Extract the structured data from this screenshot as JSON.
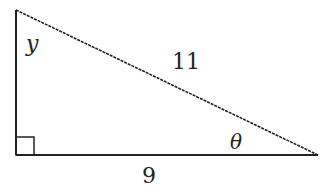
{
  "diagram": {
    "type": "right-triangle",
    "vertices": {
      "top": [
        16,
        10
      ],
      "right_angle": [
        16,
        155
      ],
      "right": [
        318,
        155
      ]
    },
    "labels": {
      "angle_top": "y",
      "hypotenuse": "11",
      "angle_right": "θ",
      "base": "9"
    },
    "right_angle_marker": true,
    "stroke_color": "#222222"
  }
}
